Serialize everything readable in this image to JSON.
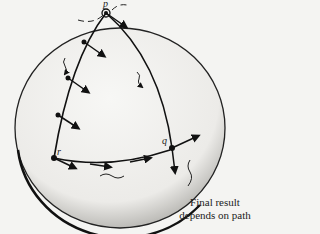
{
  "figure": {
    "labels": {
      "p": "p",
      "q": "q",
      "r": "r"
    },
    "caption_line1": "Final result",
    "caption_line2": "depends on path"
  }
}
